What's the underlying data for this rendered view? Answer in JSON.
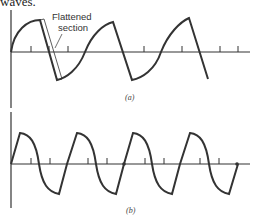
{
  "heading": "waves.",
  "figure": {
    "panel_a": {
      "caption": "(a)",
      "annotation_line1": "Flattened",
      "annotation_line2": "section",
      "description": "Sawtooth-like wave with flattened section on the falling edge"
    },
    "panel_b": {
      "caption": "(b)",
      "description": "Wave with sharp rise and rounded fall"
    }
  },
  "colors": {
    "stroke": "#333333",
    "background": "#ffffff"
  }
}
